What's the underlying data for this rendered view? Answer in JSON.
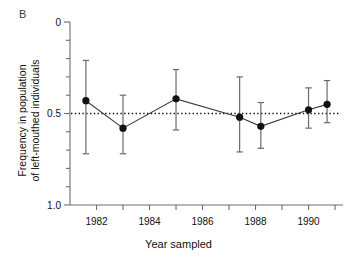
{
  "figure": {
    "panel_label": "B",
    "xlabel": "Year sampled",
    "ylabel_line1": "Frequency in population",
    "ylabel_line2": "of left-mouthed individuals"
  },
  "axes": {
    "y_tick_labels": [
      "1.0",
      "0.5",
      "0"
    ],
    "y_tick_values": [
      1.0,
      0.5,
      0
    ],
    "x_tick_labels": [
      "1982",
      "1984",
      "1986",
      "1988",
      "1990"
    ],
    "x_tick_values": [
      1982,
      1984,
      1986,
      1988,
      1990
    ]
  },
  "colors": {
    "axis": "#6e6e6e",
    "marker": "#111111",
    "line": "#3c3c3c",
    "reference": "#111111",
    "errorbar": "#6b6b6b"
  },
  "chart_data": {
    "type": "scatter",
    "title": "",
    "subtitle": "",
    "xlabel": "Year sampled",
    "ylabel": "Frequency in population of left-mouthed individuals",
    "xlim": [
      1981.0,
      1991.3
    ],
    "ylim": [
      0,
      1.0
    ],
    "y_major_ticks": [
      0,
      0.5,
      1.0
    ],
    "y_minor_ticks": [
      0.1,
      0.2,
      0.3,
      0.4,
      0.6,
      0.7,
      0.8,
      0.9
    ],
    "x_ticks": [
      1982,
      1983,
      1984,
      1985,
      1986,
      1987,
      1988,
      1989,
      1990,
      1991
    ],
    "x_major_ticks": [
      1982,
      1984,
      1986,
      1988,
      1990
    ],
    "grid": false,
    "legend": null,
    "reference_line": {
      "y": 0.5,
      "style": "dotted",
      "label": "0.5 equilibrium"
    },
    "series": [
      {
        "name": "Frequency of left-mouthed individuals",
        "marker": "filled-circle",
        "line": "solid",
        "errorbars": "vertical",
        "x": [
          1981.6,
          1983.0,
          1985.0,
          1987.4,
          1988.2,
          1990.0,
          1990.7
        ],
        "y": [
          0.57,
          0.42,
          0.58,
          0.48,
          0.43,
          0.52,
          0.55
        ],
        "y_err_low": [
          0.28,
          0.28,
          0.41,
          0.29,
          0.31,
          0.42,
          0.45
        ],
        "y_err_high": [
          0.79,
          0.6,
          0.74,
          0.7,
          0.56,
          0.64,
          0.68
        ]
      }
    ]
  }
}
